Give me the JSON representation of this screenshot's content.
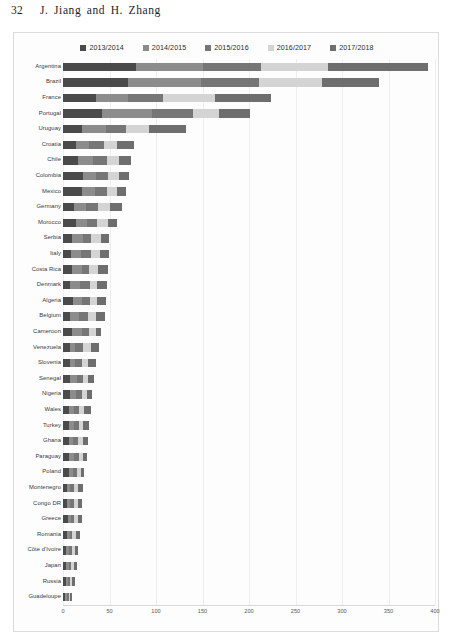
{
  "page": {
    "number": "32",
    "authors": "J. Jiang  and  H. Zhang"
  },
  "chart_data": {
    "type": "bar",
    "orientation": "horizontal",
    "stacked": true,
    "title": "",
    "xlabel": "",
    "ylabel": "",
    "xlim": [
      0,
      400
    ],
    "xticks": [
      0,
      50,
      100,
      150,
      200,
      250,
      300,
      350,
      400
    ],
    "grid": true,
    "legend_position": "top-center",
    "colors": {
      "2013/2014": "#4a4a4a",
      "2014/2015": "#8c8c8c",
      "2015/2016": "#767676",
      "2016/2017": "#d4d4d4",
      "2017/2018": "#6e6e6e"
    },
    "series": [
      {
        "name": "2013/2014",
        "color": "#4a4a4a"
      },
      {
        "name": "2014/2015",
        "color": "#8c8c8c"
      },
      {
        "name": "2015/2016",
        "color": "#767676"
      },
      {
        "name": "2016/2017",
        "color": "#d4d4d4"
      },
      {
        "name": "2017/2018",
        "color": "#6e6e6e"
      }
    ],
    "categories": [
      "Argentina",
      "Brazil",
      "France",
      "Portugal",
      "Uruguay",
      "Croatia",
      "Chile",
      "Colombia",
      "Mexico",
      "Germany",
      "Morocco",
      "Serbia",
      "Italy",
      "Costa Rica",
      "Denmark",
      "Algeria",
      "Belgium",
      "Cameroon",
      "Venezuela",
      "Slovenia",
      "Senegal",
      "Nigeria",
      "Wales",
      "Turkey",
      "Ghana",
      "Paraguay",
      "Poland",
      "Montenegro",
      "Congo DR",
      "Greece",
      "Romania",
      "Côte d'Ivoire",
      "Japan",
      "Russia",
      "Guadeloupe"
    ],
    "values": [
      [
        79,
        72,
        62,
        72,
        108
      ],
      [
        70,
        78,
        63,
        68,
        61
      ],
      [
        36,
        34,
        38,
        55,
        61
      ],
      [
        42,
        54,
        44,
        28,
        33
      ],
      [
        20,
        26,
        22,
        24,
        40
      ],
      [
        14,
        14,
        16,
        14,
        18
      ],
      [
        16,
        16,
        15,
        13,
        13
      ],
      [
        22,
        14,
        12,
        12,
        11
      ],
      [
        20,
        14,
        13,
        11,
        10
      ],
      [
        12,
        13,
        13,
        13,
        13
      ],
      [
        14,
        12,
        11,
        11,
        10
      ],
      [
        10,
        11,
        9,
        11,
        9
      ],
      [
        9,
        10,
        11,
        10,
        9
      ],
      [
        10,
        10,
        8,
        10,
        10
      ],
      [
        8,
        10,
        11,
        8,
        10
      ],
      [
        11,
        9,
        9,
        8,
        9
      ],
      [
        8,
        9,
        10,
        9,
        9
      ],
      [
        10,
        10,
        8,
        7,
        6
      ],
      [
        7,
        6,
        8,
        9,
        9
      ],
      [
        7,
        6,
        7,
        7,
        8
      ],
      [
        7,
        8,
        6,
        6,
        6
      ],
      [
        8,
        6,
        6,
        6,
        5
      ],
      [
        6,
        6,
        5,
        6,
        7
      ],
      [
        6,
        6,
        5,
        5,
        6
      ],
      [
        6,
        5,
        5,
        5,
        6
      ],
      [
        6,
        6,
        5,
        5,
        4
      ],
      [
        6,
        5,
        4,
        4,
        4
      ],
      [
        4,
        4,
        4,
        4,
        5
      ],
      [
        4,
        4,
        4,
        4,
        4
      ],
      [
        5,
        4,
        3,
        4,
        4
      ],
      [
        4,
        3,
        3,
        4,
        4
      ],
      [
        3,
        3,
        4,
        3,
        3
      ],
      [
        3,
        3,
        3,
        3,
        3
      ],
      [
        3,
        2,
        2,
        3,
        3
      ],
      [
        2,
        2,
        2,
        2,
        2
      ]
    ]
  }
}
